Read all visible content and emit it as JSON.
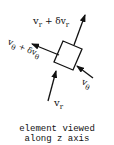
{
  "labels": {
    "vr_plus": {
      "base": "v",
      "sub": "r",
      "op": " + δv",
      "sub2": "r"
    },
    "vtheta_plus": {
      "base": "v",
      "sub": "θ",
      "op": " + δv",
      "sub2": "θ"
    },
    "vtheta": {
      "base": "v",
      "sub": "θ"
    },
    "vr": {
      "base": "v",
      "sub": "r"
    }
  },
  "caption": {
    "line1": "element viewed",
    "line2": "along z axis"
  },
  "colors": {
    "ink": "#111111",
    "background": "#ffffff"
  }
}
